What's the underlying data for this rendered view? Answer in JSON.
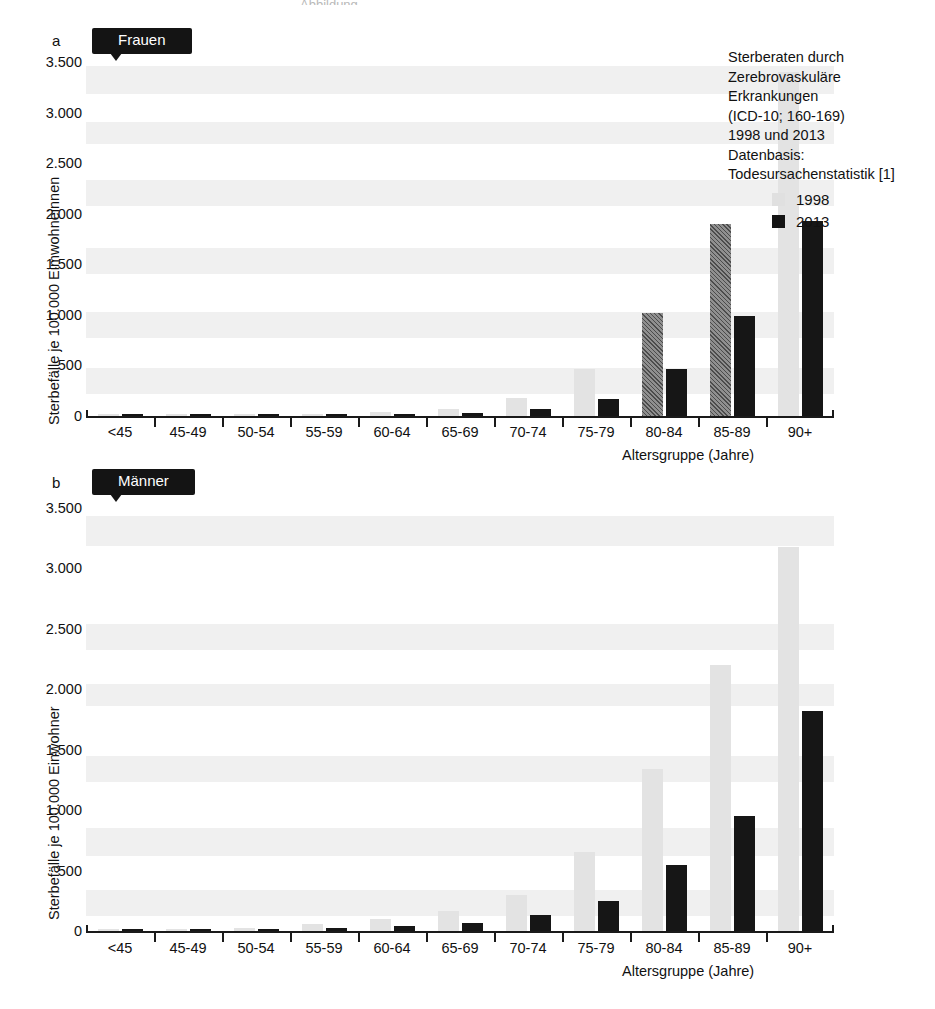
{
  "figure": {
    "top_remnant_text": "Abbildung"
  },
  "panels": [
    {
      "letter": "a",
      "chip_label": "Frauen",
      "ylabel": "Sterbefälle je 100.000 Eimwohneinnen",
      "xlabel": "Altersgruppe (Jahre)",
      "yticks": [
        "0",
        "500",
        "1.000",
        "1.500",
        "2.000",
        "2.500",
        "3.000",
        "3.500"
      ]
    },
    {
      "letter": "b",
      "chip_label": "Männer",
      "ylabel": "Sterbefälle je 100.000 Einwohner",
      "xlabel": "Altersgruppe (Jahre)",
      "yticks": [
        "0",
        "500",
        "1.000",
        "1.500",
        "2.000",
        "2.500",
        "3.000",
        "3.500"
      ]
    }
  ],
  "annotation": {
    "lines": [
      "Sterberaten durch",
      "Zerebrovaskuläre",
      "Erkrankungen",
      "(ICD-10; 160-169)",
      "1998 und 2013",
      "Datenbasis:",
      "Todesursachenstatistik [1]"
    ]
  },
  "legend": {
    "position": "top-right",
    "entries": [
      {
        "label": "1998",
        "color": "#e0e0e0"
      },
      {
        "label": "2013",
        "color": "#141414"
      }
    ]
  },
  "colors": {
    "series_1998": "#e3e3e3",
    "series_2013": "#161616",
    "axis": "#1a1a1a",
    "band": "#f0f0f0"
  },
  "chart_data": [
    {
      "type": "bar",
      "panel": "a",
      "title": "Frauen",
      "xlabel": "Altersgruppe (Jahre)",
      "ylabel": "Sterbefälle je 100.000 Eimwohneinnen",
      "ylim": [
        0,
        3500
      ],
      "ytick_values": [
        0,
        500,
        1000,
        1500,
        2000,
        2500,
        3000,
        3500
      ],
      "grid": false,
      "legend": [
        "1998",
        "2013"
      ],
      "categories": [
        "<45",
        "45-49",
        "50-54",
        "55-59",
        "60-64",
        "65-69",
        "70-74",
        "75-79",
        "80-84",
        "85-89",
        "90+"
      ],
      "series": [
        {
          "name": "1998",
          "values": [
            2,
            5,
            10,
            18,
            35,
            70,
            175,
            460,
            1020,
            1900,
            3400
          ]
        },
        {
          "name": "2013",
          "values": [
            1,
            3,
            6,
            10,
            18,
            30,
            65,
            170,
            460,
            985,
            1925
          ]
        }
      ],
      "notes": "1998 bars for age groups 80-84 and 85-89 are rendered with a dark hatched fill in the scan."
    },
    {
      "type": "bar",
      "panel": "b",
      "title": "Männer",
      "xlabel": "Altersgruppe (Jahre)",
      "ylabel": "Sterbefälle je 100.000 Einwohner",
      "ylim": [
        0,
        3500
      ],
      "ytick_values": [
        0,
        500,
        1000,
        1500,
        2000,
        2500,
        3000,
        3500
      ],
      "grid": false,
      "legend": [
        "1998",
        "2013"
      ],
      "categories": [
        "<45",
        "45-49",
        "50-54",
        "55-59",
        "60-64",
        "65-69",
        "70-74",
        "75-79",
        "80-84",
        "85-89",
        "90+"
      ],
      "series": [
        {
          "name": "1998",
          "values": [
            4,
            12,
            25,
            55,
            100,
            165,
            300,
            650,
            1340,
            2200,
            3180
          ]
        },
        {
          "name": "2013",
          "values": [
            2,
            7,
            14,
            28,
            45,
            70,
            130,
            245,
            550,
            950,
            1820
          ]
        }
      ]
    }
  ]
}
